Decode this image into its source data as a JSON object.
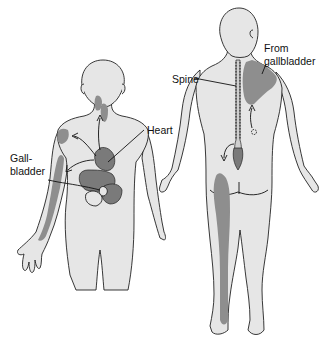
{
  "diagram": {
    "colors": {
      "background": "#ffffff",
      "skin": "#e6e6e6",
      "outline": "#222222",
      "pain_region": "#8e8e8e",
      "organ": "#7a7a7a"
    },
    "figures": [
      {
        "id": "front",
        "view": "anterior",
        "labels": [
          {
            "id": "heart",
            "text": "Heart"
          },
          {
            "id": "gallbladder",
            "text_line1": "Gall-",
            "text_line2": "bladder"
          }
        ],
        "pain_regions": [
          "neck",
          "left-shoulder",
          "left-inner-arm"
        ]
      },
      {
        "id": "back",
        "view": "posterior",
        "labels": [
          {
            "id": "spine",
            "text": "Spine"
          },
          {
            "id": "from-gallbladder",
            "text_line1": "From",
            "text_line2": "gallbladder"
          }
        ],
        "pain_regions": [
          "right-scapula",
          "posterior-leg"
        ]
      }
    ]
  }
}
